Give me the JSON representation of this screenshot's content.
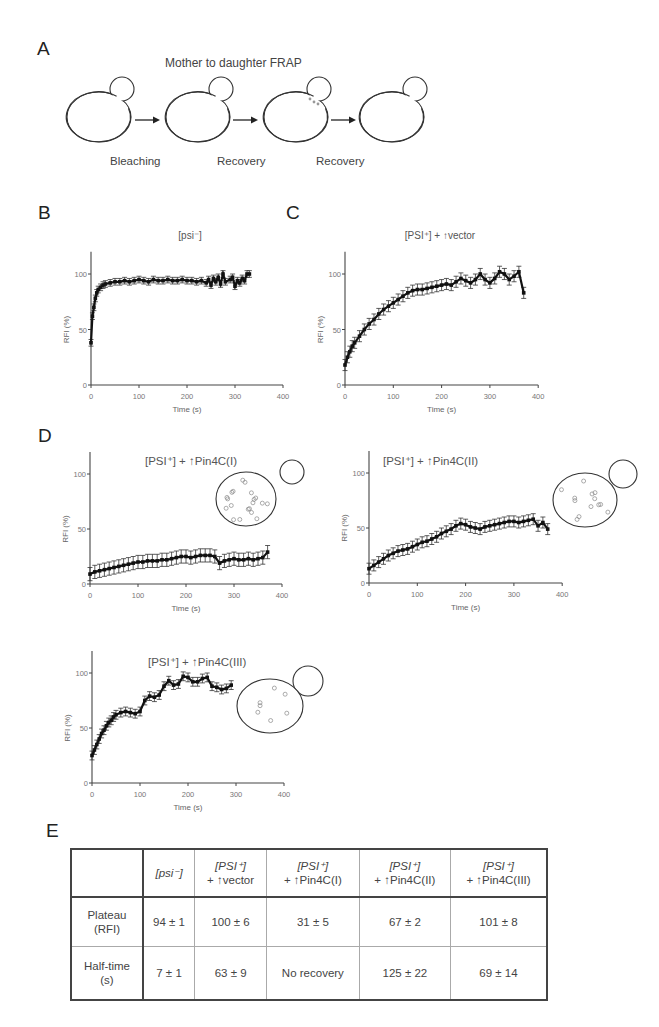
{
  "panels": {
    "A": {
      "letter": "A",
      "title": "Mother to daughter FRAP",
      "steps": [
        "Bleaching",
        "Recovery",
        "Recovery"
      ]
    },
    "B": {
      "letter": "B"
    },
    "C": {
      "letter": "C"
    },
    "D": {
      "letter": "D"
    },
    "E": {
      "letter": "E"
    }
  },
  "chart_data": [
    {
      "id": "B",
      "type": "line",
      "title": "[psi⁻]",
      "xlabel": "Time (s)",
      "ylabel": "RFI (%)",
      "xlim": [
        0,
        400
      ],
      "ylim": [
        0,
        120
      ],
      "xticks": [
        0,
        100,
        200,
        300,
        400
      ],
      "yticks": [
        0,
        50,
        100
      ],
      "x": [
        0,
        3,
        6,
        9,
        12,
        15,
        20,
        25,
        30,
        40,
        50,
        60,
        70,
        80,
        90,
        100,
        110,
        120,
        130,
        140,
        150,
        160,
        170,
        180,
        190,
        200,
        210,
        220,
        230,
        240,
        245,
        250,
        255,
        260,
        265,
        270,
        275,
        280,
        290,
        295,
        300,
        305,
        310,
        315,
        320,
        325,
        330
      ],
      "values": [
        38,
        62,
        70,
        78,
        83,
        86,
        88,
        90,
        91,
        92,
        93,
        93,
        94,
        93,
        94,
        95,
        94,
        93,
        95,
        94,
        94,
        95,
        94,
        94,
        95,
        94,
        94,
        93,
        94,
        92,
        95,
        90,
        96,
        93,
        97,
        91,
        100,
        93,
        95,
        97,
        89,
        94,
        92,
        96,
        94,
        100,
        100
      ],
      "error": 3
    },
    {
      "id": "C",
      "type": "line",
      "title": "[PSI⁺] + ↑vector",
      "xlabel": "Time (s)",
      "ylabel": "RFI (%)",
      "xlim": [
        0,
        400
      ],
      "ylim": [
        0,
        120
      ],
      "xticks": [
        0,
        100,
        200,
        300,
        400
      ],
      "yticks": [
        0,
        50,
        100
      ],
      "x": [
        0,
        5,
        10,
        15,
        20,
        30,
        40,
        50,
        60,
        70,
        80,
        90,
        100,
        110,
        120,
        130,
        140,
        150,
        160,
        170,
        180,
        190,
        200,
        210,
        220,
        230,
        240,
        250,
        260,
        270,
        280,
        290,
        300,
        310,
        320,
        330,
        340,
        350,
        360,
        370
      ],
      "values": [
        18,
        25,
        30,
        35,
        38,
        44,
        50,
        55,
        59,
        64,
        68,
        71,
        74,
        77,
        80,
        83,
        85,
        86,
        86,
        87,
        88,
        89,
        90,
        91,
        90,
        93,
        96,
        94,
        92,
        95,
        100,
        95,
        92,
        96,
        102,
        100,
        95,
        98,
        102,
        83
      ],
      "error": 5
    },
    {
      "id": "D1",
      "type": "line",
      "title": "[PSI⁺] + ↑Pin4C(I)",
      "xlabel": "Time (s)",
      "ylabel": "RFI (%)",
      "xlim": [
        0,
        400
      ],
      "ylim": [
        0,
        120
      ],
      "xticks": [
        0,
        100,
        200,
        300,
        400
      ],
      "yticks": [
        0,
        50,
        100
      ],
      "x": [
        0,
        10,
        20,
        30,
        40,
        50,
        60,
        70,
        80,
        90,
        100,
        110,
        120,
        130,
        140,
        150,
        160,
        170,
        180,
        190,
        200,
        210,
        220,
        230,
        240,
        250,
        260,
        270,
        280,
        290,
        300,
        310,
        320,
        330,
        340,
        350,
        360,
        370
      ],
      "values": [
        9,
        11,
        12,
        13,
        14,
        15,
        16,
        17,
        18,
        19,
        20,
        20,
        21,
        21,
        21,
        22,
        22,
        23,
        24,
        25,
        25,
        24,
        25,
        26,
        26,
        26,
        25,
        19,
        21,
        22,
        23,
        22,
        22,
        23,
        22,
        23,
        24,
        29
      ],
      "error": 6
    },
    {
      "id": "D2",
      "type": "line",
      "title": "[PSI⁺] + ↑Pin4C(II)",
      "xlabel": "Time (s)",
      "ylabel": "RFI (%)",
      "xlim": [
        0,
        400
      ],
      "ylim": [
        0,
        120
      ],
      "xticks": [
        0,
        100,
        200,
        300,
        400
      ],
      "yticks": [
        0,
        50,
        100
      ],
      "x": [
        0,
        10,
        20,
        30,
        40,
        50,
        60,
        70,
        80,
        90,
        100,
        110,
        120,
        130,
        140,
        150,
        160,
        170,
        180,
        190,
        200,
        210,
        220,
        230,
        240,
        250,
        260,
        270,
        280,
        290,
        300,
        310,
        320,
        330,
        340,
        350,
        360,
        370
      ],
      "values": [
        13,
        16,
        19,
        22,
        25,
        27,
        29,
        30,
        31,
        33,
        35,
        37,
        38,
        40,
        42,
        45,
        47,
        49,
        52,
        54,
        53,
        51,
        50,
        49,
        51,
        52,
        53,
        54,
        55,
        56,
        56,
        55,
        56,
        57,
        58,
        52,
        55,
        49
      ],
      "error": 5
    },
    {
      "id": "D3",
      "type": "line",
      "title": "[PSI⁺] + ↑Pin4C(III)",
      "xlabel": "Time (s)",
      "ylabel": "RFI (%)",
      "xlim": [
        0,
        400
      ],
      "ylim": [
        0,
        120
      ],
      "xticks": [
        0,
        100,
        200,
        300,
        400
      ],
      "yticks": [
        0,
        50,
        100
      ],
      "x": [
        0,
        5,
        10,
        15,
        20,
        25,
        30,
        35,
        40,
        45,
        50,
        60,
        70,
        80,
        90,
        100,
        110,
        120,
        130,
        140,
        150,
        160,
        170,
        180,
        190,
        200,
        210,
        220,
        230,
        240,
        250,
        260,
        270,
        280,
        290
      ],
      "values": [
        25,
        30,
        35,
        40,
        45,
        48,
        52,
        55,
        57,
        60,
        62,
        64,
        65,
        64,
        63,
        65,
        75,
        79,
        78,
        80,
        88,
        93,
        89,
        90,
        97,
        96,
        92,
        92,
        95,
        96,
        88,
        87,
        85,
        86,
        89
      ],
      "error": 4
    }
  ],
  "insets": {
    "D1": {
      "dots": 20,
      "label": "many puncta"
    },
    "D2": {
      "dots": 13,
      "label": "moderate puncta"
    },
    "D3": {
      "dots": 7,
      "label": "few puncta"
    }
  },
  "table": {
    "headers": [
      {
        "line1": "",
        "line2": ""
      },
      {
        "line1": "[psi⁻]",
        "line2": ""
      },
      {
        "line1": "[PSI⁺]",
        "line2": "+ ↑vector"
      },
      {
        "line1": "[PSI⁺]",
        "line2": "+ ↑Pin4C(I)"
      },
      {
        "line1": "[PSI⁺]",
        "line2": "+ ↑Pin4C(II)"
      },
      {
        "line1": "[PSI⁺]",
        "line2": "+ ↑Pin4C(III)"
      }
    ],
    "rows": [
      {
        "label1": "Plateau",
        "label2": "(RFI)",
        "cells": [
          "94 ± 1",
          "100 ± 6",
          "31 ± 5",
          "67 ± 2",
          "101 ± 8"
        ]
      },
      {
        "label1": "Half-time",
        "label2": "(s)",
        "cells": [
          "7 ± 1",
          "63 ± 9",
          "No recovery",
          "125 ± 22",
          "69 ± 14"
        ]
      }
    ]
  }
}
